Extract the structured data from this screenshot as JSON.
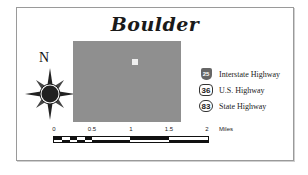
{
  "title": "Boulder",
  "north_label": "N",
  "map": {
    "fill_color": "#8f8f8f",
    "point_of_interest_color": "#efefef"
  },
  "legend": {
    "items": [
      {
        "shield": "25",
        "label": "Interstate Highway",
        "icon": "interstate-shield-icon"
      },
      {
        "shield": "36",
        "label": "U.S. Highway",
        "icon": "us-highway-shield-icon"
      },
      {
        "shield": "83",
        "label": "State Highway",
        "icon": "state-highway-shield-icon"
      }
    ]
  },
  "scale_bar": {
    "ticks": [
      "0",
      "0.5",
      "1",
      "1.5",
      "2"
    ],
    "units": "Miles"
  }
}
